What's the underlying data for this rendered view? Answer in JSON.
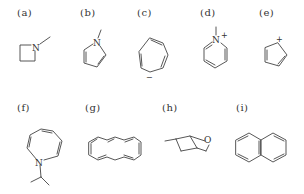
{
  "figure": {
    "title": "",
    "molecules": [
      {
        "id": "a",
        "label": "(a)",
        "name": "N-methylazetidine",
        "atoms": [
          "N"
        ],
        "charge": ""
      },
      {
        "id": "b",
        "label": "(b)",
        "name": "N-methylpyrrole",
        "atoms": [
          "N"
        ],
        "charge": ""
      },
      {
        "id": "c",
        "label": "(c)",
        "name": "cycloheptatrienyl anion",
        "atoms": [],
        "charge": "−"
      },
      {
        "id": "d",
        "label": "(d)",
        "name": "N-methylpyridinium",
        "atoms": [
          "N"
        ],
        "charge": "+"
      },
      {
        "id": "e",
        "label": "(e)",
        "name": "cyclopentadienyl cation",
        "atoms": [],
        "charge": "+"
      },
      {
        "id": "f",
        "label": "(f)",
        "name": "N-isopropylazepine",
        "atoms": [
          "N"
        ],
        "charge": ""
      },
      {
        "id": "g",
        "label": "(g)",
        "name": "bicyclic [10]annulene",
        "atoms": [],
        "charge": ""
      },
      {
        "id": "h",
        "label": "(h)",
        "name": "methyltetrahydropyran (chair)",
        "atoms": [
          "O"
        ],
        "charge": ""
      },
      {
        "id": "i",
        "label": "(i)",
        "name": "naphthalene",
        "atoms": [],
        "charge": ""
      }
    ]
  },
  "labels": {
    "a": "(a)",
    "b": "(b)",
    "c": "(c)",
    "d": "(d)",
    "e": "(e)",
    "f": "(f)",
    "g": "(g)",
    "h": "(h)",
    "i": "(i)"
  },
  "atoms": {
    "a_N": "N",
    "b_N": "N",
    "d_N": "N",
    "f_N": "N",
    "h_O": "O"
  },
  "charges": {
    "c": "−",
    "d": "+",
    "e": "+"
  }
}
